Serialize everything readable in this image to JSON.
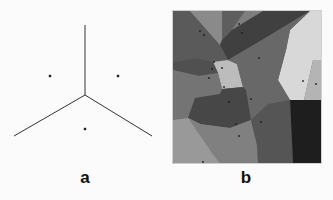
{
  "figure": {
    "panels": [
      {
        "label": "a",
        "description": "Voronoi diagram of three points",
        "edges": [
          {
            "x1": 85,
            "y1": 25,
            "x2": 85,
            "y2": 95
          },
          {
            "x1": 85,
            "y1": 95,
            "x2": 14,
            "y2": 136
          },
          {
            "x1": 85,
            "y1": 95,
            "x2": 152,
            "y2": 136
          }
        ],
        "points": [
          {
            "x": 50,
            "y": 76
          },
          {
            "x": 118,
            "y": 76
          },
          {
            "x": 85,
            "y": 129
          }
        ],
        "colors": {
          "line": "#333333",
          "point": "#222222"
        }
      },
      {
        "label": "b",
        "description": "Voronoi tessellation with grayscale-filled cells",
        "bounds": {
          "x": 173,
          "y": 11,
          "width": 148,
          "height": 152
        },
        "cells": [
          {
            "fill": "#5a5a5a",
            "points": "173,11 190,11 220,45 228,60 213,62 198,58 173,62"
          },
          {
            "fill": "#8a8a8a",
            "points": "190,11 222,11 222,40 220,45"
          },
          {
            "fill": "#5e5e5e",
            "points": "222,11 245,11 232,30 222,40"
          },
          {
            "fill": "#7e7e7e",
            "points": "245,11 263,11 232,30"
          },
          {
            "fill": "#404040",
            "points": "263,11 310,11 262,40 228,60 220,45 222,40 232,30"
          },
          {
            "fill": "#6a6a6a",
            "points": "310,11 290,30 286,50 278,80 290,100 304,100 313,60 317,11"
          },
          {
            "fill": "#d8d8d8",
            "points": "317,11 321,11 321,60 313,60 304,100 290,100 278,80 286,50 290,30 310,11"
          },
          {
            "fill": "#b4b4b4",
            "points": "313,60 321,60 321,100 304,100"
          },
          {
            "fill": "#bcbcbc",
            "points": "228,60 237,64 243,87 222,89 218,73 213,62"
          },
          {
            "fill": "#505050",
            "points": "173,62 198,58 213,62 218,73 199,76 173,70"
          },
          {
            "fill": "#686868",
            "points": "262,40 310,11 290,30 286,50 278,80 290,100 268,104 251,120 246,90 243,87 237,64 228,60"
          },
          {
            "fill": "#747474",
            "points": "173,70 199,76 218,73 222,89 220,94 195,98 188,118 173,120"
          },
          {
            "fill": "#474747",
            "points": "222,89 243,87 246,90 251,120 230,128 200,124 188,118 195,98 220,94"
          },
          {
            "fill": "#999999",
            "points": "173,120 188,118 200,124 210,150 220,163 173,163"
          },
          {
            "fill": "#808080",
            "points": "188,118 200,124 230,128 251,120 257,145 258,163 220,163 210,150"
          },
          {
            "fill": "#555555",
            "points": "251,120 268,104 290,100 293,163 258,163 257,145"
          },
          {
            "fill": "#1e1e1e",
            "points": "290,100 304,100 321,100 321,163 293,163"
          }
        ],
        "points": [
          {
            "x": 204,
            "y": 35
          },
          {
            "x": 200,
            "y": 31
          },
          {
            "x": 239,
            "y": 24
          },
          {
            "x": 242,
            "y": 33
          },
          {
            "x": 214,
            "y": 62
          },
          {
            "x": 222,
            "y": 68
          },
          {
            "x": 212,
            "y": 69
          },
          {
            "x": 209,
            "y": 78
          },
          {
            "x": 259,
            "y": 58
          },
          {
            "x": 303,
            "y": 81
          },
          {
            "x": 316,
            "y": 84
          },
          {
            "x": 224,
            "y": 87
          },
          {
            "x": 251,
            "y": 99
          },
          {
            "x": 229,
            "y": 102
          },
          {
            "x": 261,
            "y": 122
          },
          {
            "x": 236,
            "y": 124
          },
          {
            "x": 239,
            "y": 136
          },
          {
            "x": 203,
            "y": 162
          }
        ],
        "colors": {
          "point": "#1a1a1a",
          "border": "#cfcfcf"
        }
      }
    ]
  }
}
